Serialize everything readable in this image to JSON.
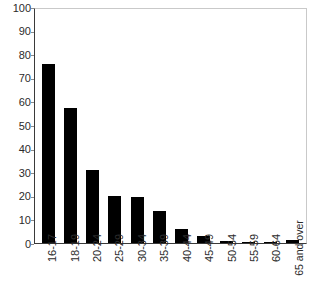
{
  "chart_data": {
    "type": "bar",
    "title": "",
    "subtitle": "",
    "xlabel": "",
    "ylabel": "",
    "ylim": [
      0,
      100
    ],
    "ytick_step": 10,
    "yticks": [
      100,
      90,
      80,
      70,
      60,
      50,
      40,
      30,
      20,
      10,
      0
    ],
    "ytick_labels": [
      "100",
      "90",
      "80",
      "70",
      "60",
      "50",
      "40",
      "30",
      "20",
      "10",
      "0"
    ],
    "grid": false,
    "legend": null,
    "legend_position": "none",
    "bar_color": "#000000",
    "categories": [
      "16-17",
      "18-19",
      "20-24",
      "25-29",
      "30-34",
      "35-39",
      "40-44",
      "45-49",
      "50-54",
      "55-59",
      "60-64",
      "65 and over"
    ],
    "values": [
      76,
      57,
      31,
      20,
      19.5,
      13.5,
      6,
      3,
      0.8,
      0.3,
      0.2,
      1.2
    ]
  },
  "axis": {
    "frame_color": "#c9c9c9",
    "line_color": "#3a3a3a",
    "tick_color": "#8a8a8a",
    "text_color": "#2b2b2b"
  }
}
